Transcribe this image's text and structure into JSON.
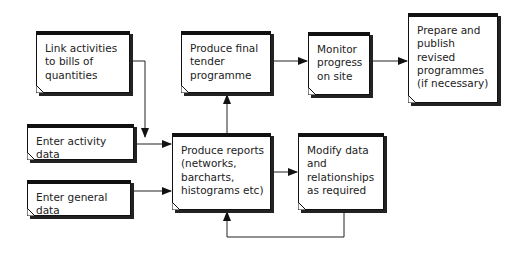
{
  "diagram": {
    "nodes": [
      {
        "id": "link",
        "label": "Link activities\nto bills of\nquantities"
      },
      {
        "id": "final",
        "label": "Produce final\ntender\nprogramme"
      },
      {
        "id": "monitor",
        "label": "Monitor\nprogress\non site"
      },
      {
        "id": "publish",
        "label": "Prepare and\npublish\nrevised\nprogrammes\n(if necessary)"
      },
      {
        "id": "activity",
        "label": "Enter activity data"
      },
      {
        "id": "general",
        "label": "Enter general data"
      },
      {
        "id": "reports",
        "label": "Produce reports\n(networks,\nbarcharts,\nhistograms etc)"
      },
      {
        "id": "modify",
        "label": "Modify data\nand\nrelationships\nas required"
      }
    ],
    "edges": [
      {
        "from": "link",
        "to": "reports"
      },
      {
        "from": "activity",
        "to": "reports"
      },
      {
        "from": "general",
        "to": "reports"
      },
      {
        "from": "reports",
        "to": "final"
      },
      {
        "from": "final",
        "to": "monitor"
      },
      {
        "from": "monitor",
        "to": "publish"
      },
      {
        "from": "reports",
        "to": "modify"
      },
      {
        "from": "modify",
        "to": "reports"
      }
    ]
  }
}
